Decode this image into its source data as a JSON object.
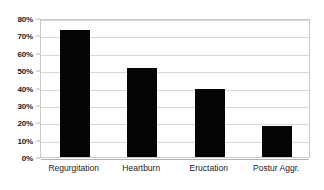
{
  "chart_data": {
    "type": "bar",
    "title": "",
    "subtitle": "",
    "xlabel": "",
    "ylabel": "",
    "categories": [
      "Regurgitation",
      "Heartburn",
      "Eructation",
      "Postur Aggr."
    ],
    "values": [
      73,
      51,
      39,
      18
    ],
    "series": [
      {
        "name": "",
        "values": [
          73,
          51,
          39,
          18
        ]
      }
    ],
    "ylim": [
      0,
      80
    ],
    "ytick_values": [
      80,
      70,
      60,
      50,
      40,
      30,
      20,
      10,
      0
    ],
    "ytick_labels": [
      "80%",
      "70%",
      "60%",
      "50%",
      "40%",
      "30%",
      "20%",
      "10%",
      "0%"
    ],
    "grid": true,
    "legend": false,
    "legend_position": "none",
    "bar_color": "#050505",
    "gridline_color": "#d8d8d8",
    "plot_border_color": "#c9c9c9",
    "background_color": "#ffffff"
  }
}
